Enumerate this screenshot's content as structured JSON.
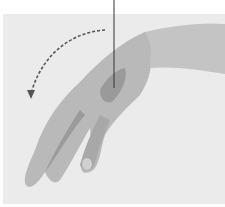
{
  "figure": {
    "colors": {
      "background": "#ebebeb",
      "skin": "#b9b9b9",
      "skin_shadow": "#8f8f8f",
      "highlight_area": "#9a9a9a",
      "arrow": "#555555",
      "pointer_line": "#333333"
    },
    "arrow": {
      "style": "dashed",
      "direction": "down"
    }
  }
}
